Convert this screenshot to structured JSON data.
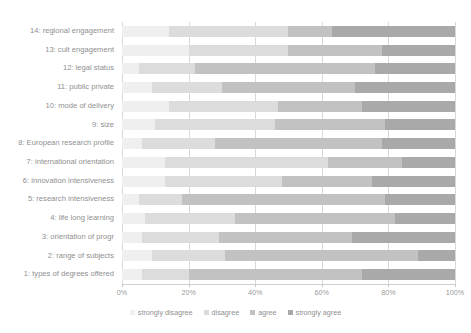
{
  "chart_data": {
    "type": "bar",
    "orientation": "horizontal",
    "stacked": "percent",
    "title": "",
    "xlabel": "",
    "ylabel": "",
    "xlim": [
      0,
      100
    ],
    "xticks": [
      "0%",
      "20%",
      "40%",
      "60%",
      "80%",
      "100%"
    ],
    "xtick_values": [
      0,
      20,
      40,
      60,
      80,
      100
    ],
    "grid": true,
    "legend_position": "bottom",
    "legend": [
      "strongly disagree",
      "disagree",
      "agree",
      "strongly agree"
    ],
    "series": [
      {
        "name": "strongly disagree",
        "color": "#efefef"
      },
      {
        "name": "disagree",
        "color": "#dcdcdc"
      },
      {
        "name": "agree",
        "color": "#c2c2c2"
      },
      {
        "name": "strongly agree",
        "color": "#a9a9a9"
      }
    ],
    "categories": [
      "14: regional engagement",
      "13: cult engagement",
      "12: legal status",
      "11: public private",
      "10: mode of delivery",
      "9: size",
      "8: European research profile",
      "7: international orientation",
      "6: innovation intensiveness",
      "5: research intensiveness",
      "4: life long learning",
      "3: orientation of progr",
      "2: range of subjects",
      "1: types of degrees offered"
    ],
    "values": [
      [
        14,
        36,
        13,
        37
      ],
      [
        20,
        30,
        28,
        22
      ],
      [
        5,
        17,
        54,
        24
      ],
      [
        9,
        21,
        40,
        30
      ],
      [
        14,
        33,
        25,
        28
      ],
      [
        10,
        36,
        33,
        21
      ],
      [
        6,
        22,
        50,
        22
      ],
      [
        13,
        49,
        22,
        16
      ],
      [
        13,
        35,
        27,
        25
      ],
      [
        5,
        13,
        61,
        21
      ],
      [
        7,
        27,
        48,
        18
      ],
      [
        6,
        23,
        40,
        31
      ],
      [
        9,
        22,
        58,
        11
      ],
      [
        6,
        14,
        52,
        28
      ]
    ]
  }
}
